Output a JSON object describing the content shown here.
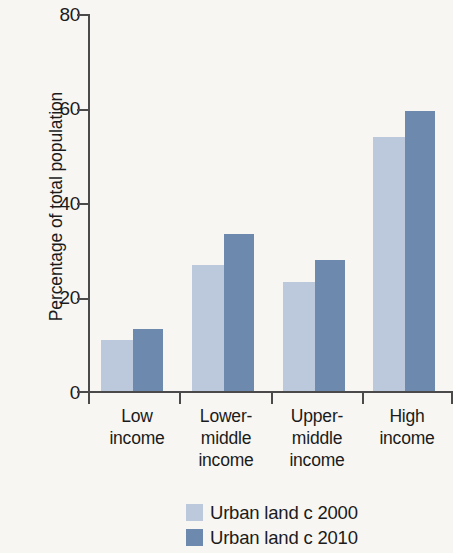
{
  "chart_data": {
    "type": "bar",
    "title": "",
    "subtitle": "",
    "xlabel": "",
    "ylabel": "Percentage of total population",
    "ylim": [
      0,
      80
    ],
    "yticks": [
      0,
      20,
      40,
      60,
      80
    ],
    "grid": false,
    "legend_position": "bottom",
    "categories": [
      "Low\nincome",
      "Lower-\nmiddle\nincome",
      "Upper-\nmiddle\nincome",
      "High\nincome"
    ],
    "series": [
      {
        "name": "Urban land c 2000",
        "color": "#bcc9dd",
        "values": [
          10.8,
          26.8,
          23.2,
          53.9
        ]
      },
      {
        "name": "Urban land c 2010",
        "color": "#6d89ad",
        "values": [
          13.1,
          33.4,
          27.7,
          59.4
        ]
      }
    ]
  },
  "axis": {
    "y_title": "Percentage of total population",
    "y_tick_labels": [
      "80",
      "60",
      "40",
      "20",
      "0"
    ]
  },
  "categories": [
    {
      "label": "Low\nincome"
    },
    {
      "label": "Lower-\nmiddle\nincome"
    },
    {
      "label": "Upper-\nmiddle\nincome"
    },
    {
      "label": "High\nincome"
    }
  ],
  "legend": {
    "items": [
      {
        "label": "Urban land c 2000",
        "swatch": "light"
      },
      {
        "label": "Urban land c 2010",
        "swatch": "dark"
      }
    ]
  },
  "colors": {
    "series_2000": "#bcc9dd",
    "series_2010": "#6d89ad",
    "axis": "#4a4a4a",
    "background": "#f7f6f3",
    "text": "#1b1b1b"
  }
}
